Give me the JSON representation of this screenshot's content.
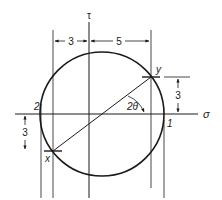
{
  "diagram": {
    "type": "mohr-circle",
    "axes": {
      "horizontal_label": "σ",
      "vertical_label": "τ"
    },
    "points": {
      "x_label": "x",
      "y_label": "y",
      "principal_1_label": "1",
      "principal_2_label": "2"
    },
    "angle_label": "2θ",
    "dimensions": {
      "top_left": "3",
      "top_right": "5",
      "right_vertical": "3",
      "left_vertical": "3"
    },
    "colors": {
      "stroke": "#1a1a1a",
      "background": "#ffffff"
    }
  }
}
